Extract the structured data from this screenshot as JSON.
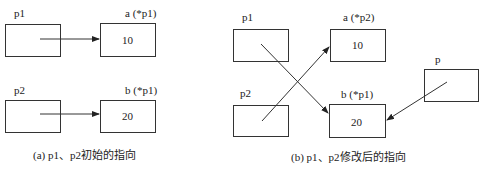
{
  "panel_a": {
    "caption": "(a) p1、p2初始的指向",
    "p1_label": "p1",
    "p2_label": "p2",
    "a_label": "a (*p1)",
    "b_label": "b (*p1)",
    "a_value": "10",
    "b_value": "20"
  },
  "panel_b": {
    "caption": "(b) p1、p2修改后的指向",
    "p1_label": "p1",
    "p2_label": "p2",
    "a_label": "a (*p2)",
    "b_label": "b (*p1)",
    "p_label": "p",
    "a_value": "10",
    "b_value": "20"
  },
  "colors": {
    "stroke": "#333333",
    "background": "#ffffff"
  }
}
